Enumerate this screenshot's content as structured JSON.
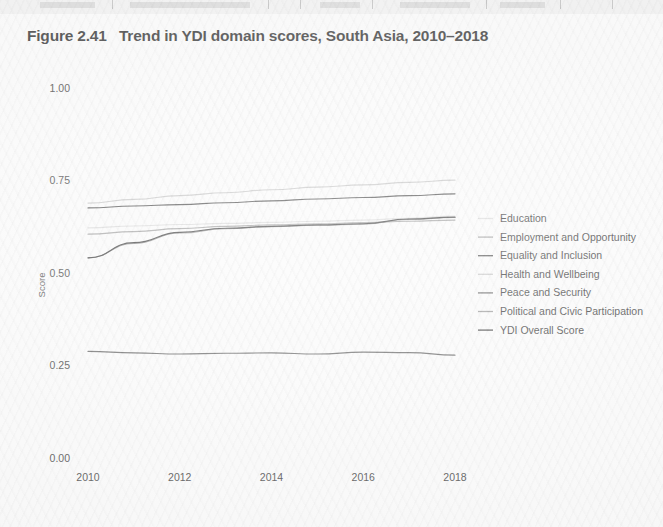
{
  "figure": {
    "title": "Figure 2.41   Trend in YDI domain scores, South Asia, 2010–2018"
  },
  "chart_data": {
    "type": "line",
    "title": "Figure 2.41   Trend in YDI domain scores, South Asia, 2010–2018",
    "xlabel": "",
    "ylabel": "Score",
    "xlim": [
      2010,
      2018
    ],
    "ylim": [
      0.0,
      1.0
    ],
    "grid": false,
    "legend_position": "right",
    "x": [
      2010,
      2011,
      2012,
      2013,
      2014,
      2015,
      2016,
      2017,
      2018
    ],
    "xticks": [
      "2010",
      "2012",
      "2014",
      "2016",
      "2018"
    ],
    "xtick_values": [
      2010,
      2012,
      2014,
      2016,
      2018
    ],
    "yticks": [
      "0.00",
      "0.25",
      "0.50",
      "0.75",
      "1.00"
    ],
    "ytick_values": [
      0.0,
      0.25,
      0.5,
      0.75,
      1.0
    ],
    "series": [
      {
        "name": "Education",
        "color": "#d9d9d9",
        "values": [
          0.622,
          0.627,
          0.631,
          0.634,
          0.637,
          0.64,
          0.643,
          0.648,
          0.654
        ]
      },
      {
        "name": "Employment and Opportunity",
        "color": "#9a9a9a",
        "values": [
          0.605,
          0.612,
          0.62,
          0.626,
          0.63,
          0.633,
          0.636,
          0.64,
          0.643
        ]
      },
      {
        "name": "Equality and Inclusion",
        "color": "#3c3c3c",
        "values": [
          0.676,
          0.681,
          0.685,
          0.69,
          0.695,
          0.7,
          0.704,
          0.709,
          0.714
        ]
      },
      {
        "name": "Health and Wellbeing",
        "color": "#c2c2c2",
        "values": [
          0.689,
          0.699,
          0.709,
          0.717,
          0.725,
          0.732,
          0.738,
          0.745,
          0.751
        ]
      },
      {
        "name": "Peace and Security",
        "color": "#555555",
        "values": [
          0.288,
          0.284,
          0.281,
          0.283,
          0.284,
          0.281,
          0.286,
          0.285,
          0.278
        ]
      },
      {
        "name": "Political and Civic Participation",
        "color": "#8e8e8e",
        "values": [
          0.541,
          0.58,
          0.608,
          0.62,
          0.625,
          0.629,
          0.632,
          0.645,
          0.65
        ]
      },
      {
        "name": "YDI Overall Score",
        "color": "#2b2b2b",
        "values": [
          0.541,
          0.582,
          0.61,
          0.621,
          0.626,
          0.63,
          0.633,
          0.646,
          0.651
        ]
      }
    ]
  },
  "legend": {
    "items": [
      {
        "label": "Education"
      },
      {
        "label": "Employment and Opportunity"
      },
      {
        "label": "Equality and Inclusion"
      },
      {
        "label": "Health and Wellbeing"
      },
      {
        "label": "Peace and Security"
      },
      {
        "label": "Political and Civic Participation"
      },
      {
        "label": "YDI Overall Score"
      }
    ]
  }
}
